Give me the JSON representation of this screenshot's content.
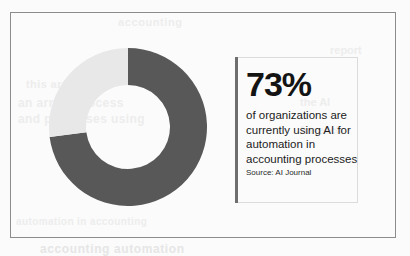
{
  "canvas": {
    "width": 410,
    "height": 254,
    "background_color": "#fbfbfb",
    "frame_border_color": "#8c8c8c"
  },
  "stat_panel": {
    "big_number": "73%",
    "lines": [
      "of organizations are",
      "currently using AI for",
      "automation in",
      "accounting processes"
    ],
    "source": "Source: AI Journal",
    "accent_bar_color": "#6e6e6e",
    "border_color": "#dcdcdc",
    "text_color": "#1c1c1c"
  },
  "ghost_text": {
    "note": "faint bleed-through text visible behind the graphic",
    "fragments": [
      "accounting",
      "report",
      "this are",
      "an arrow process",
      "and processes using",
      "the AI",
      "for each",
      "automation in accounting",
      "accounting automation"
    ]
  },
  "chart_data": {
    "type": "pie",
    "variant": "donut",
    "title": "",
    "start_angle_deg": 0,
    "direction": "clockwise",
    "inner_radius_ratio": 0.53,
    "labels": [
      "Using AI for automation",
      "Not using AI for automation"
    ],
    "values": [
      73,
      27
    ],
    "units": "percent",
    "colors": [
      "#585858",
      "#e8e8e8"
    ],
    "legend": "none",
    "data_labels": "none",
    "center_x": 79,
    "center_y": 79,
    "outer_radius": 79,
    "inner_radius": 42
  }
}
